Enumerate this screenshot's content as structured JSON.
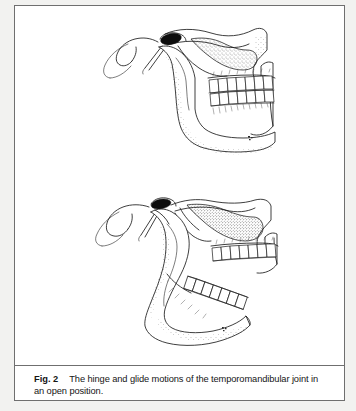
{
  "figure": {
    "caption_label": "Fig. 2",
    "caption_text": "The hinge and glide motions of the temporomandibular joint in an open position.",
    "border_color": "#6f6f6f",
    "page_background": "#f2f2f0",
    "figure_background": "#ffffff",
    "ink_color": "#1c1c1c"
  },
  "illustrations": [
    {
      "id": "closed-position",
      "name": "temporomandibular-joint-closed",
      "description": "Lateral view line drawing of the skull temporomandibular joint region with the mandible in the closed position, upper and lower teeth in occlusion, articular disc shown as a solid dark mass atop the mandibular condyle.",
      "position": "upper",
      "labels": []
    },
    {
      "id": "open-position",
      "name": "temporomandibular-joint-open",
      "description": "Lateral view line drawing of the same region with the mandible depressed and the condyle translated forward along the articular eminence, illustrating combined hinge and glide motion; upper and lower tooth rows are separated.",
      "position": "lower",
      "labels": []
    }
  ]
}
